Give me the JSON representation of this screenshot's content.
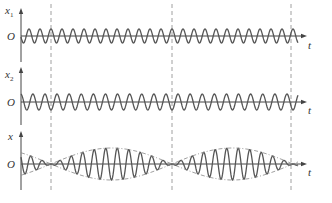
{
  "chart_data": {
    "type": "line",
    "title": "",
    "x_axis_label": "t",
    "origin_label": "O",
    "panels": [
      {
        "name": "x1",
        "ylabel": "x",
        "ylabel_sub": "1",
        "series": "x1 = A cos(ω1 t)",
        "cycles_per_beat": 11,
        "amplitude_rel": 1.0,
        "phase_note": "peak at dashed lines"
      },
      {
        "name": "x2",
        "ylabel": "x",
        "ylabel_sub": "2",
        "series": "x2 = A cos(ω2 t)",
        "cycles_per_beat": 10,
        "amplitude_rel": 1.0,
        "phase_note": "trough at dashed lines"
      },
      {
        "name": "x",
        "ylabel": "x",
        "ylabel_sub": "",
        "series": "x = x1 + x2",
        "amplitude_rel": 2.0,
        "envelope": "dashed ±2A|cos((ω1-ω2)t/2)|",
        "phase_note": "nodes at dashed lines"
      }
    ],
    "vertical_dashed_lines_px": [
      51,
      172,
      291
    ],
    "beat_period_px": 121,
    "grid": false,
    "legend": null
  },
  "layout": {
    "axis_x_px": 21,
    "axis_end_px": 306,
    "panel_axes_y_px": [
      36,
      102,
      164
    ],
    "panel_axis_top_px": [
      9,
      68,
      132
    ],
    "panel_axis_bottom_px": [
      62,
      125,
      190
    ],
    "amp_px": [
      7,
      8,
      16
    ]
  },
  "colors": {
    "curve": "#555555",
    "axis": "#444444",
    "dashed": "#888888"
  },
  "labels": {
    "origin": "O",
    "t": "t",
    "x": "x",
    "sub1": "1",
    "sub2": "2"
  }
}
